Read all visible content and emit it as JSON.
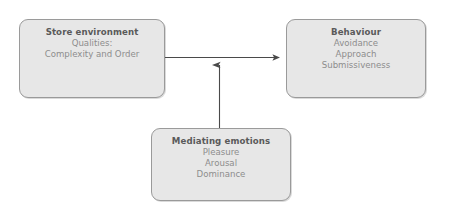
{
  "diagram": {
    "type": "flow-diagram",
    "background_color": "#ffffff",
    "box_fill_color": "#e7e7e7",
    "box_border_color": "#9a9a9a",
    "title_color": "#5a5a5a",
    "body_text_color": "#8d8d8d",
    "arrow_color": "#4a4a4a",
    "nodes": [
      {
        "id": "store-environment",
        "title": "Store environment",
        "lines": [
          "Qualities:",
          "Complexity and Order"
        ]
      },
      {
        "id": "behaviour",
        "title": "Behaviour",
        "lines": [
          "Avoidance",
          "Approach",
          "Submissiveness"
        ]
      },
      {
        "id": "mediating-emotions",
        "title": "Mediating emotions",
        "lines": [
          "Pleasure",
          "Arousal",
          "Dominance"
        ]
      }
    ],
    "edges": [
      {
        "id": "store-environment-to-behaviour",
        "from": "store-environment",
        "to": "behaviour",
        "direction": "horizontal-right"
      },
      {
        "id": "mediating-emotions-to-arrow",
        "from": "mediating-emotions",
        "to": "store-environment-to-behaviour",
        "direction": "vertical-up"
      }
    ]
  }
}
